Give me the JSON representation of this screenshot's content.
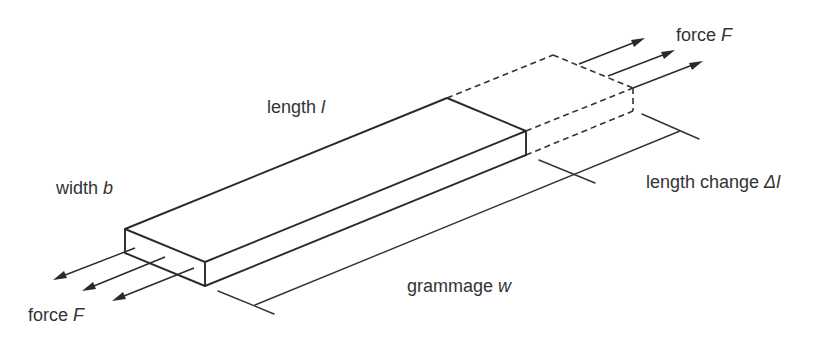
{
  "figure": {
    "type": "tensile test specimen schematic",
    "labels": {
      "length": {
        "text": "length ",
        "symbol": "l"
      },
      "width": {
        "text": "width ",
        "symbol": "b"
      },
      "force_top": {
        "text": "force ",
        "symbol": "F"
      },
      "force_bottom": {
        "text": "force ",
        "symbol": "F"
      },
      "length_change": {
        "text": "length change ",
        "symbol": "Δl"
      },
      "grammage": {
        "text": "grammage ",
        "symbol": "w"
      }
    },
    "colors": {
      "line": "#2a2a2a",
      "text": "#333333",
      "background": "#ffffff"
    }
  }
}
